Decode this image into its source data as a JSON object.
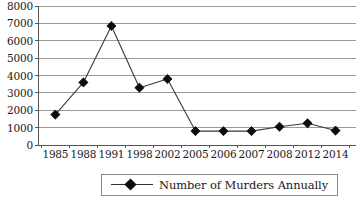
{
  "chart_data": {
    "type": "line",
    "title": "",
    "xlabel": "",
    "ylabel": "",
    "categories": [
      "1985",
      "1988",
      "1991",
      "1998",
      "2002",
      "2005",
      "2006",
      "2007",
      "2008",
      "2012",
      "2014"
    ],
    "series": [
      {
        "name": "Number of Murders Annually",
        "values": [
          1750,
          3600,
          6850,
          3300,
          3800,
          800,
          800,
          800,
          1050,
          1250,
          830
        ]
      }
    ],
    "ylim": [
      0,
      8000
    ],
    "yticks": [
      0,
      1000,
      2000,
      3000,
      4000,
      5000,
      6000,
      7000,
      8000
    ],
    "ytick_labels": [
      "0",
      "1000",
      "2000",
      "3000",
      "4000",
      "5000",
      "6000",
      "7000",
      "8000"
    ],
    "grid": "horizontal",
    "legend_position": "bottom",
    "marker": "diamond",
    "line_color": "#3a3a3a",
    "marker_color": "#0d0d0d",
    "grid_color": "#9a9a9a",
    "axis_color": "#555555"
  },
  "legend": {
    "entries": [
      {
        "label": "Number of Murders Annually"
      }
    ]
  }
}
